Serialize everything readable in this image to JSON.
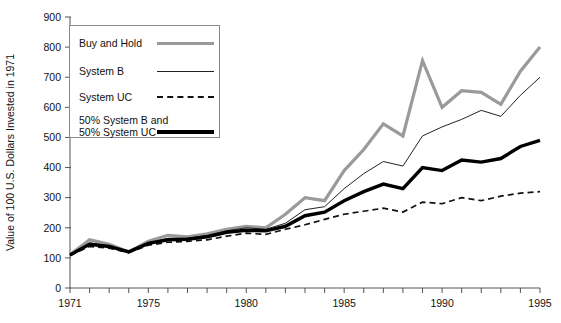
{
  "chart_data": {
    "type": "line",
    "title": "",
    "xlabel": "",
    "ylabel": "Value of 100 U.S. Dollars Invested in 1971",
    "xlim": [
      1971,
      1995
    ],
    "ylim": [
      0,
      900
    ],
    "ytick_labels": [
      "0",
      "100",
      "200",
      "300",
      "400",
      "500",
      "600",
      "700",
      "800",
      "900"
    ],
    "ytick_values": [
      0,
      100,
      200,
      300,
      400,
      500,
      600,
      700,
      800,
      900
    ],
    "xtick_labels": [
      "1971",
      "1975",
      "1980",
      "1985",
      "1990",
      "1995"
    ],
    "xtick_values": [
      1971,
      1975,
      1980,
      1985,
      1990,
      1995
    ],
    "x_minor_tick_step": 1,
    "grid": false,
    "legend_position": "upper-left-inside",
    "x": [
      1971,
      1972,
      1973,
      1974,
      1975,
      1976,
      1977,
      1978,
      1979,
      1980,
      1981,
      1982,
      1983,
      1984,
      1985,
      1986,
      1987,
      1988,
      1989,
      1990,
      1991,
      1992,
      1993,
      1994,
      1995
    ],
    "series": [
      {
        "name": "Buy and Hold",
        "style": "thick-gray-solid",
        "color": "#9a9a9a",
        "values": [
          110,
          160,
          145,
          120,
          155,
          175,
          170,
          180,
          195,
          205,
          200,
          245,
          300,
          290,
          390,
          460,
          545,
          505,
          755,
          600,
          655,
          650,
          610,
          720,
          800
        ]
      },
      {
        "name": "System B",
        "style": "thin-black-solid",
        "color": "#222222",
        "values": [
          110,
          150,
          140,
          120,
          150,
          165,
          165,
          175,
          190,
          200,
          195,
          215,
          260,
          270,
          330,
          380,
          420,
          405,
          505,
          535,
          560,
          590,
          570,
          640,
          700
        ]
      },
      {
        "name": "System UC",
        "style": "black-dashed",
        "color": "#111111",
        "values": [
          108,
          138,
          132,
          118,
          142,
          152,
          155,
          160,
          172,
          182,
          178,
          195,
          210,
          228,
          245,
          255,
          265,
          252,
          285,
          280,
          300,
          290,
          305,
          315,
          320
        ]
      },
      {
        "name": "50% System B and 50% System UC",
        "style": "thick-black-solid",
        "color": "#000000",
        "values": [
          110,
          145,
          138,
          120,
          148,
          160,
          162,
          170,
          185,
          192,
          190,
          205,
          240,
          252,
          290,
          320,
          345,
          330,
          400,
          390,
          425,
          418,
          430,
          470,
          490
        ]
      }
    ]
  },
  "legend": {
    "items": [
      {
        "label": "Buy and Hold",
        "label2": ""
      },
      {
        "label": "System B",
        "label2": ""
      },
      {
        "label": "System UC",
        "label2": ""
      },
      {
        "label": "50% System B and",
        "label2": "50% System UC"
      }
    ]
  },
  "axis": {
    "y_title": "Value of 100 U.S. Dollars Invested in 1971"
  }
}
